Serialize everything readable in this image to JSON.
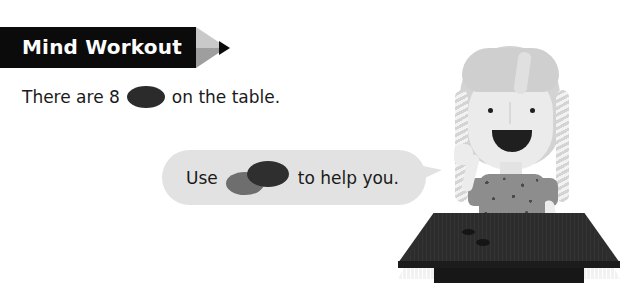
{
  "page": {
    "background_color": "#ffffff",
    "width": 627,
    "height": 303
  },
  "banner": {
    "title": "Mind Workout",
    "bar_color": "#0b0b0b",
    "text_color": "#ffffff",
    "wedge_color": "#c9c9c9",
    "wedge_shade_color": "#9e9e9e",
    "arrow_icon": "triangle-right-icon",
    "arrow_color": "#0b0b0b"
  },
  "sentence": {
    "text_before": "There are 8",
    "text_after": "on the table.",
    "counter_icon": "counter-disc-icon",
    "counter_color": "#2b2b2b",
    "count": "8"
  },
  "bubble": {
    "text_before": "Use",
    "text_after": "to help you.",
    "fill_color": "#e2e2e2",
    "tail_direction": "right",
    "counters": [
      {
        "icon": "counter-disc-gray-icon",
        "color": "#6e6e6e"
      },
      {
        "icon": "counter-disc-dark-icon",
        "color": "#2f2f2f"
      }
    ]
  },
  "character": {
    "name": "girl-illustration",
    "hair_color": "#d3d3d3",
    "skin_color": "#ebebeb",
    "top_color": "#8d8d8d",
    "features": {
      "eyes": "dot-eyes-icon",
      "nose": "nose-line-icon",
      "mouth": "open-smile-icon",
      "braid_left": "braid-icon",
      "braid_right": "braid-icon"
    }
  },
  "table": {
    "name": "wooden-table",
    "top_color": "#2e2e2e",
    "edge_color": "#1c1c1c",
    "base_color": "#171717",
    "counters_on_table": 2
  }
}
